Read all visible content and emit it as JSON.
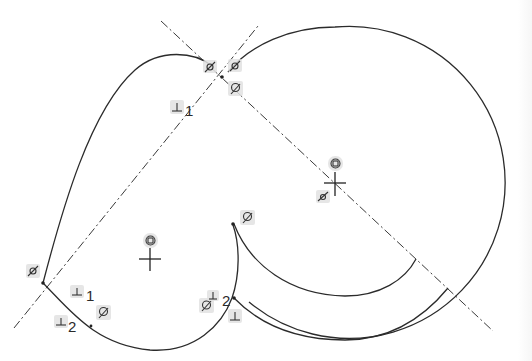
{
  "drawing": {
    "title": "Sketch with constraints",
    "colors": {
      "background": "#ffffff",
      "geometry": "#2b2b2b",
      "constraint_badge": "#e2e2e2"
    },
    "labels": {
      "perp_1_top": "1",
      "perp_1_bottom": "1",
      "perp_2_bottom": "2",
      "perp_2_right": "2"
    },
    "constraints": [
      {
        "type": "parallel",
        "icon": "parallel-icon",
        "location": "top-left of intersection"
      },
      {
        "type": "parallel",
        "icon": "parallel-icon",
        "location": "top-right of intersection"
      },
      {
        "type": "tangent",
        "icon": "tangent-icon",
        "location": "below intersection"
      },
      {
        "type": "perpendicular",
        "icon": "perpendicular-icon",
        "label": "1",
        "location": "upper-left line"
      },
      {
        "type": "concentric",
        "icon": "concentric-icon",
        "location": "large circle center"
      },
      {
        "type": "parallel",
        "icon": "parallel-icon",
        "location": "large circle center"
      },
      {
        "type": "concentric",
        "icon": "concentric-icon",
        "location": "small circle center"
      },
      {
        "type": "tangent",
        "icon": "tangent-icon",
        "location": "inner arc start"
      },
      {
        "type": "parallel",
        "icon": "parallel-icon",
        "location": "left vertex"
      },
      {
        "type": "perpendicular",
        "icon": "perpendicular-icon",
        "label": "1",
        "location": "bottom-left"
      },
      {
        "type": "perpendicular",
        "icon": "perpendicular-icon",
        "label": "2",
        "location": "bottom-left"
      },
      {
        "type": "tangent",
        "icon": "tangent-icon",
        "location": "bottom-left arc"
      },
      {
        "type": "tangent",
        "icon": "tangent-icon",
        "location": "bottom-middle"
      },
      {
        "type": "perpendicular",
        "icon": "perpendicular-icon",
        "label": "2",
        "location": "bottom-middle"
      },
      {
        "type": "perpendicular",
        "icon": "perpendicular-icon",
        "location": "bottom-middle right"
      }
    ]
  }
}
